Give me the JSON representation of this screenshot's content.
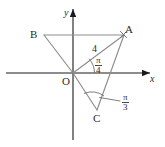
{
  "figure": {
    "type": "geometry-diagram",
    "background_color": "#ffffff",
    "axis_color": "#1a1a1a",
    "line_color": "#8d8d8d",
    "text_color": "#2b2b2b",
    "axes": {
      "x_label": "x",
      "y_label": "y",
      "origin_label": "O"
    },
    "points": [
      {
        "id": "A",
        "label": "A",
        "marker": "x-marker",
        "x": 124,
        "y": 35
      },
      {
        "id": "B",
        "label": "B",
        "marker": "none",
        "x": 44,
        "y": 35
      },
      {
        "id": "C",
        "label": "C",
        "marker": "none",
        "x": 97,
        "y": 110
      },
      {
        "id": "O",
        "label": "O",
        "marker": "none",
        "x": 73,
        "y": 73
      }
    ],
    "segments": [
      {
        "from": "B",
        "to": "A"
      },
      {
        "from": "B",
        "to": "O"
      },
      {
        "from": "O",
        "to": "A"
      },
      {
        "from": "O",
        "to": "C"
      },
      {
        "from": "C",
        "to": "A"
      }
    ],
    "length_labels": [
      {
        "segment": "OA",
        "value": "4"
      }
    ],
    "angles": [
      {
        "id": "angle-at-origin",
        "vertex": "O",
        "numerator": "π",
        "denominator": "4"
      },
      {
        "id": "angle-at-c",
        "vertex": "C",
        "numerator": "π",
        "denominator": "3"
      }
    ]
  }
}
